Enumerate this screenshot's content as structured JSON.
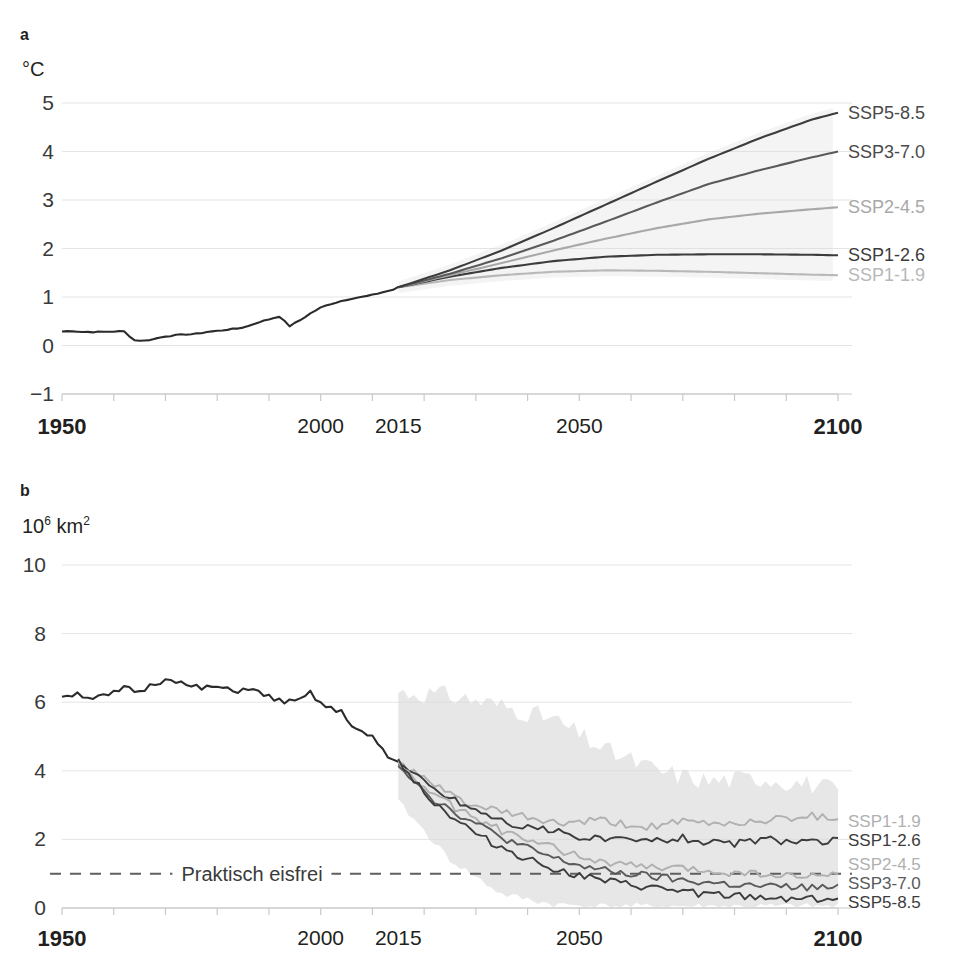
{
  "figure": {
    "panel_a_letter": "a",
    "panel_b_letter": "b"
  },
  "panel_a": {
    "y_unit": "°C",
    "y_ticks": [
      "5",
      "4",
      "3",
      "2",
      "1",
      "0",
      "−1"
    ],
    "x_ticks": [
      {
        "label": "1950",
        "year": 1950,
        "bold": true
      },
      {
        "label": "2000",
        "year": 2000,
        "bold": false
      },
      {
        "label": "2015",
        "year": 2015,
        "bold": false
      },
      {
        "label": "2050",
        "year": 2050,
        "bold": false
      },
      {
        "label": "2100",
        "year": 2100,
        "bold": true
      }
    ],
    "labels": [
      {
        "text": "SSP5-8.5",
        "color": "#4a4a4a",
        "value": 4.8
      },
      {
        "text": "SSP3-7.0",
        "color": "#4a4a4a",
        "value": 4.0
      },
      {
        "text": "SSP2-4.5",
        "color": "#a8a8a8",
        "value": 2.85
      },
      {
        "text": "SSP1-2.6",
        "color": "#3c3c3c",
        "value": 1.86
      },
      {
        "text": "SSP1-1.9",
        "color": "#b8b8b8",
        "value": 1.45
      }
    ]
  },
  "panel_b": {
    "y_unit_base": "10",
    "y_unit_exp": "6",
    "y_unit_rest": " km",
    "y_unit_rest_exp": "2",
    "y_ticks": [
      "10",
      "8",
      "6",
      "4",
      "2",
      "0"
    ],
    "x_ticks": [
      {
        "label": "1950",
        "year": 1950,
        "bold": true
      },
      {
        "label": "2000",
        "year": 2000,
        "bold": false
      },
      {
        "label": "2015",
        "year": 2015,
        "bold": false
      },
      {
        "label": "2050",
        "year": 2050,
        "bold": false
      },
      {
        "label": "2100",
        "year": 2100,
        "bold": true
      }
    ],
    "ice_free_label": "Praktisch eisfrei",
    "ice_free_level": 1.0,
    "labels": [
      {
        "text": "SSP1-1.9",
        "color": "#b0b0b0",
        "value": 2.62
      },
      {
        "text": "SSP1-2.6",
        "color": "#3c3c3c",
        "value": 1.95
      },
      {
        "text": "SSP2-4.5",
        "color": "#b0b0b0",
        "value": 1.0
      },
      {
        "text": "SSP3-7.0",
        "color": "#5a5a5a",
        "value": 0.58
      },
      {
        "text": "SSP5-8.5",
        "color": "#3c3c3c",
        "value": 0.28
      }
    ]
  },
  "colors": {
    "ssp119": "#b8b8b8",
    "ssp126": "#3c3c3c",
    "ssp245": "#a8a8a8",
    "ssp370": "#5a5a5a",
    "ssp585": "#3c3c3c",
    "historical": "#2b2b2b",
    "grid": "#e4e4e4",
    "axis": "#c9c9c9",
    "band": "#d9d9d9"
  },
  "chart_data": [
    {
      "type": "line",
      "id": "panel-a",
      "title": "",
      "xlabel": "",
      "ylabel": "°C",
      "xlim": [
        1950,
        2100
      ],
      "ylim": [
        -1,
        5
      ],
      "grid": true,
      "legend_position": "right-of-plot",
      "annotations": [
        "a"
      ],
      "x_tick_values": [
        1950,
        2000,
        2015,
        2050,
        2100
      ],
      "y_tick_values": [
        -1,
        0,
        1,
        2,
        3,
        4,
        5
      ],
      "series": [
        {
          "name": "historical",
          "color": "#2b2b2b",
          "x": [
            1950,
            1952,
            1954,
            1956,
            1958,
            1960,
            1962,
            1964,
            1966,
            1968,
            1970,
            1972,
            1974,
            1976,
            1978,
            1980,
            1982,
            1984,
            1986,
            1988,
            1990,
            1992,
            1994,
            1996,
            1998,
            2000,
            2002,
            2004,
            2006,
            2008,
            2010,
            2012,
            2014,
            2015
          ],
          "values": [
            0.29,
            0.3,
            0.28,
            0.28,
            0.28,
            0.29,
            0.29,
            0.11,
            0.1,
            0.14,
            0.19,
            0.21,
            0.23,
            0.24,
            0.28,
            0.3,
            0.33,
            0.35,
            0.4,
            0.48,
            0.54,
            0.6,
            0.4,
            0.52,
            0.66,
            0.78,
            0.86,
            0.92,
            0.97,
            1.0,
            1.04,
            1.1,
            1.15,
            1.2
          ]
        },
        {
          "name": "SSP1-1.9",
          "color": "#b8b8b8",
          "x": [
            2015,
            2025,
            2035,
            2045,
            2055,
            2065,
            2075,
            2085,
            2095,
            2100
          ],
          "values": [
            1.2,
            1.35,
            1.45,
            1.52,
            1.55,
            1.54,
            1.52,
            1.49,
            1.46,
            1.45
          ]
        },
        {
          "name": "SSP1-2.6",
          "color": "#3c3c3c",
          "x": [
            2015,
            2025,
            2035,
            2045,
            2055,
            2065,
            2075,
            2085,
            2095,
            2100
          ],
          "values": [
            1.2,
            1.42,
            1.6,
            1.74,
            1.83,
            1.87,
            1.88,
            1.88,
            1.87,
            1.86
          ]
        },
        {
          "name": "SSP2-4.5",
          "color": "#a8a8a8",
          "x": [
            2015,
            2025,
            2035,
            2045,
            2055,
            2065,
            2075,
            2085,
            2095,
            2100
          ],
          "values": [
            1.2,
            1.45,
            1.7,
            1.96,
            2.2,
            2.42,
            2.6,
            2.72,
            2.81,
            2.85
          ]
        },
        {
          "name": "SSP3-7.0",
          "color": "#5a5a5a",
          "x": [
            2015,
            2025,
            2035,
            2045,
            2055,
            2065,
            2075,
            2085,
            2095,
            2100
          ],
          "values": [
            1.2,
            1.48,
            1.8,
            2.16,
            2.55,
            2.95,
            3.33,
            3.62,
            3.88,
            4.0
          ]
        },
        {
          "name": "SSP5-8.5",
          "color": "#3c3c3c",
          "x": [
            2015,
            2025,
            2035,
            2045,
            2055,
            2065,
            2075,
            2085,
            2095,
            2100
          ],
          "values": [
            1.2,
            1.55,
            1.96,
            2.42,
            2.9,
            3.38,
            3.85,
            4.28,
            4.66,
            4.8
          ]
        }
      ]
    },
    {
      "type": "line",
      "id": "panel-b",
      "title": "",
      "xlabel": "",
      "ylabel": "10^6 km^2",
      "xlim": [
        1950,
        2100
      ],
      "ylim": [
        0,
        10
      ],
      "grid": true,
      "legend_position": "right-of-plot",
      "annotations": [
        "b",
        "Praktisch eisfrei"
      ],
      "x_tick_values": [
        1950,
        2000,
        2015,
        2050,
        2100
      ],
      "y_tick_values": [
        0,
        2,
        4,
        6,
        8,
        10
      ],
      "reference_line": {
        "label": "Praktisch eisfrei",
        "y": 1.0,
        "style": "dashed"
      },
      "uncertainty_band": {
        "x": [
          2015,
          2025,
          2035,
          2045,
          2055,
          2065,
          2075,
          2085,
          2095,
          2100
        ],
        "upper": [
          6.3,
          6.2,
          5.9,
          5.5,
          4.6,
          4.0,
          3.7,
          3.8,
          3.6,
          3.4
        ],
        "lower": [
          3.1,
          1.4,
          0.4,
          0.1,
          0.05,
          0.05,
          0.05,
          0.05,
          0.05,
          0.05
        ],
        "color": "#d9d9d9"
      },
      "series": [
        {
          "name": "historical",
          "color": "#2b2b2b",
          "x": [
            1950,
            1953,
            1956,
            1959,
            1962,
            1965,
            1968,
            1971,
            1974,
            1977,
            1980,
            1983,
            1986,
            1989,
            1992,
            1995,
            1998,
            2001,
            2004,
            2007,
            2010,
            2013,
            2015
          ],
          "values": [
            6.2,
            6.25,
            6.12,
            6.18,
            6.4,
            6.3,
            6.55,
            6.72,
            6.48,
            6.4,
            6.45,
            6.3,
            6.42,
            6.2,
            6.05,
            5.98,
            6.25,
            5.85,
            5.7,
            5.2,
            4.95,
            4.4,
            4.25
          ]
        },
        {
          "name": "SSP1-1.9",
          "color": "#b0b0b0",
          "x": [
            2015,
            2022,
            2030,
            2038,
            2046,
            2054,
            2062,
            2070,
            2078,
            2086,
            2094,
            2100
          ],
          "values": [
            4.25,
            3.55,
            2.95,
            2.7,
            2.45,
            2.55,
            2.35,
            2.5,
            2.45,
            2.55,
            2.7,
            2.62
          ]
        },
        {
          "name": "SSP1-2.6",
          "color": "#3c3c3c",
          "x": [
            2015,
            2022,
            2030,
            2038,
            2046,
            2054,
            2062,
            2070,
            2078,
            2086,
            2094,
            2100
          ],
          "values": [
            4.25,
            3.45,
            2.85,
            2.4,
            2.2,
            2.0,
            1.95,
            2.05,
            1.85,
            2.0,
            1.9,
            1.95
          ]
        },
        {
          "name": "SSP2-4.5",
          "color": "#b0b0b0",
          "x": [
            2015,
            2022,
            2030,
            2038,
            2046,
            2054,
            2062,
            2070,
            2078,
            2086,
            2094,
            2100
          ],
          "values": [
            4.2,
            3.25,
            2.6,
            2.05,
            1.7,
            1.35,
            1.2,
            1.15,
            1.05,
            1.0,
            0.9,
            1.0
          ]
        },
        {
          "name": "SSP3-7.0",
          "color": "#5a5a5a",
          "x": [
            2015,
            2022,
            2030,
            2038,
            2046,
            2054,
            2062,
            2070,
            2078,
            2086,
            2094,
            2100
          ],
          "values": [
            4.2,
            3.15,
            2.45,
            1.85,
            1.4,
            1.1,
            0.95,
            0.8,
            0.7,
            0.62,
            0.6,
            0.58
          ]
        },
        {
          "name": "SSP5-8.5",
          "color": "#3c3c3c",
          "x": [
            2015,
            2022,
            2030,
            2038,
            2046,
            2054,
            2062,
            2070,
            2078,
            2086,
            2094,
            2100
          ],
          "values": [
            4.3,
            3.05,
            2.15,
            1.55,
            1.1,
            0.8,
            0.62,
            0.48,
            0.35,
            0.3,
            0.28,
            0.28
          ]
        }
      ]
    }
  ]
}
